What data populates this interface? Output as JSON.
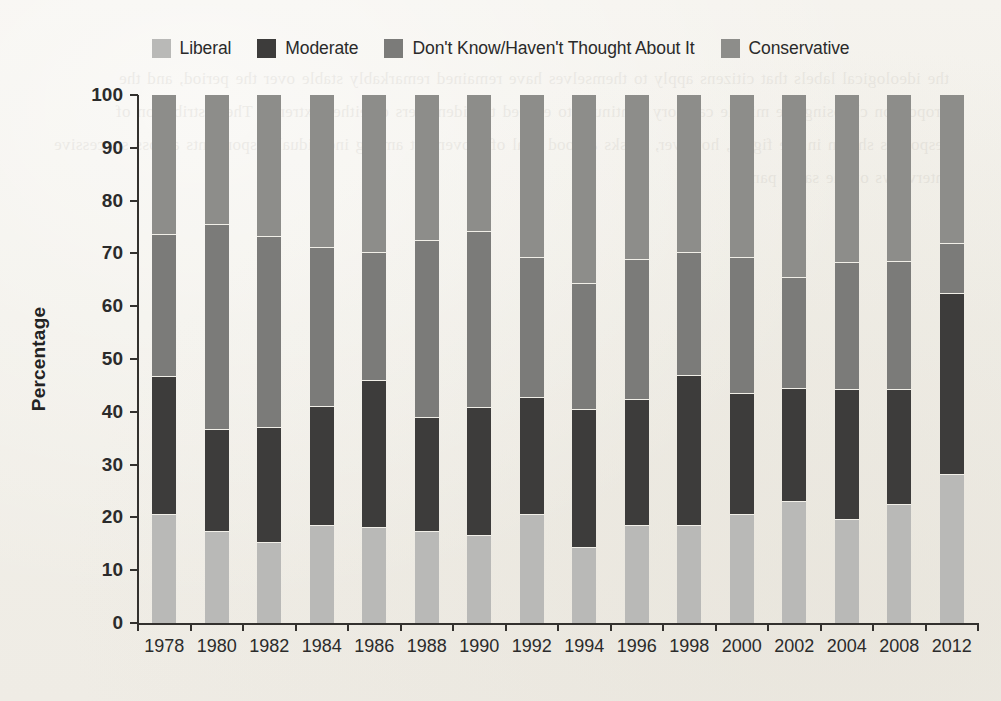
{
  "chart_data": {
    "type": "bar",
    "stacked": true,
    "title": "",
    "subtitle": "",
    "xlabel": "",
    "ylabel": "Percentage",
    "ylim": [
      0,
      100
    ],
    "yticks": [
      0,
      10,
      20,
      30,
      40,
      50,
      60,
      70,
      80,
      90,
      100
    ],
    "grid": false,
    "legend_position": "top",
    "categories": [
      "1978",
      "1980",
      "1982",
      "1984",
      "1986",
      "1988",
      "1990",
      "1992",
      "1994",
      "1996",
      "1998",
      "2000",
      "2002",
      "2004",
      "2008",
      "2012"
    ],
    "stack_order_bottom_to_top": [
      "Liberal",
      "Moderate",
      "Don't Know/Haven't Thought About It",
      "Conservative"
    ],
    "series": [
      {
        "name": "Liberal",
        "color": "#b9b9b7",
        "values": [
          20.4,
          17.3,
          15.2,
          18.3,
          18.0,
          17.3,
          16.4,
          20.4,
          14.3,
          18.3,
          18.4,
          20.5,
          23.0,
          19.5,
          22.4,
          28.0
        ]
      },
      {
        "name": "Moderate",
        "color": "#3d3c3b",
        "values": [
          26.2,
          19.3,
          21.8,
          22.7,
          27.9,
          21.6,
          24.3,
          22.2,
          26.1,
          23.9,
          28.3,
          22.8,
          21.3,
          24.6,
          21.7,
          34.3
        ]
      },
      {
        "name": "Don't Know/Haven't Thought About It",
        "color": "#7b7b79",
        "values": [
          26.9,
          38.7,
          36.1,
          30.0,
          24.1,
          33.4,
          33.3,
          26.5,
          23.8,
          26.5,
          23.3,
          25.9,
          21.0,
          24.1,
          24.3,
          9.4
        ]
      },
      {
        "name": "Conservative",
        "color": "#8d8d8a",
        "values": [
          26.5,
          24.7,
          26.9,
          29.0,
          30.0,
          27.7,
          26.0,
          30.9,
          35.8,
          31.3,
          30.0,
          30.8,
          34.7,
          31.8,
          31.6,
          28.3
        ]
      }
    ],
    "segment_tops": {
      "1978": [
        20.4,
        46.6,
        73.5,
        100
      ],
      "1980": [
        17.3,
        36.6,
        75.3,
        100
      ],
      "1982": [
        15.2,
        37.0,
        73.1,
        100
      ],
      "1984": [
        18.3,
        41.0,
        71.0,
        100
      ],
      "1986": [
        18.0,
        45.9,
        70.0,
        100
      ],
      "1988": [
        17.3,
        38.9,
        72.3,
        100
      ],
      "1990": [
        16.4,
        40.7,
        74.0,
        100
      ],
      "1992": [
        20.4,
        42.6,
        69.1,
        100
      ],
      "1994": [
        14.3,
        40.4,
        64.2,
        100
      ],
      "1996": [
        18.3,
        42.2,
        68.7,
        100
      ],
      "1998": [
        18.4,
        46.7,
        70.0,
        100
      ],
      "2000": [
        20.5,
        43.3,
        69.2,
        100
      ],
      "2002": [
        23.0,
        44.3,
        65.3,
        100
      ],
      "2004": [
        19.5,
        44.1,
        68.2,
        100
      ],
      "2008": [
        22.4,
        44.1,
        68.4,
        100
      ],
      "2012": [
        28.0,
        62.3,
        71.7,
        100
      ]
    }
  },
  "legend": {
    "items": [
      {
        "label": "Liberal",
        "color": "#b9b9b7"
      },
      {
        "label": "Moderate",
        "color": "#3d3c3b"
      },
      {
        "label": "Don't Know/Haven't Thought About It",
        "color": "#7b7b79"
      },
      {
        "label": "Conservative",
        "color": "#8d8d8a"
      }
    ]
  },
  "axes": {
    "y_title": "Percentage"
  },
  "page": {
    "bleed_text": "the ideological labels that citizens apply to themselves have remained remarkably stable over the period, and the proportion choosing the middle category continues to exceed the identifiers of either extreme. The distribution of responses shown in the figure, however, masks a good deal of movement among individual respondents across successive interviews of the same panel."
  }
}
